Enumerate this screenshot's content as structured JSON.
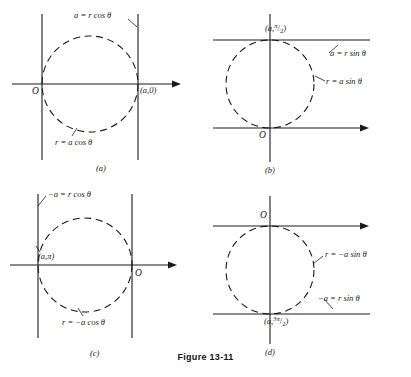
{
  "figure": {
    "caption": "Figure 13-11",
    "axis_color": "#1a1a1a",
    "curve_color": "#1a1a1a",
    "background": "#ffffff"
  },
  "panels": [
    {
      "key": "a",
      "letter": "(a)",
      "origin_label": "O",
      "point_label_a": "a",
      "point_label_b": "0",
      "point_label": "(a,0)",
      "line_label": "a = r cos θ",
      "curve_label": "r = a cos θ",
      "equation_line": "a = r cos θ",
      "equation_curve": "r = a cos θ",
      "description": "Circle tangent to the vertical line through the origin and to the vertical line x = a; horizontal polar axis points right."
    },
    {
      "key": "b",
      "letter": "(b)",
      "origin_label": "O",
      "point_label": "(a, π/2)",
      "point_num": "π",
      "point_den": "2",
      "point_prefix": "(a,",
      "point_suffix": ")",
      "line_label": "a = r sin θ",
      "curve_label": "r = a sin θ",
      "equation_line": "a = r sin θ",
      "equation_curve": "r = a sin θ",
      "description": "Circle tangent to the horizontal polar axis at the origin and to the horizontal line y = a above."
    },
    {
      "key": "c",
      "letter": "(c)",
      "origin_label": "O",
      "point_label": "(a,π)",
      "line_label": "−a = r cos θ",
      "curve_label": "r = −a cos θ",
      "equation_line": "−a = r cos θ",
      "equation_curve": "r = −a cos θ",
      "description": "Circle tangent to the vertical line through the origin on the right and to the vertical line x = −a on the left."
    },
    {
      "key": "d",
      "letter": "(d)",
      "origin_label": "O",
      "point_label": "(a, 3π/2)",
      "point_prefix": "(a,",
      "point_num": "3π",
      "point_den": "2",
      "point_suffix": ")",
      "line_label": "−a = r sin θ",
      "curve_label": "r = −a sin θ",
      "equation_line": "−a = r sin θ",
      "equation_curve": "r = −a sin θ",
      "description": "Circle tangent to the horizontal polar axis at the origin and to the horizontal line y = −a below."
    }
  ]
}
